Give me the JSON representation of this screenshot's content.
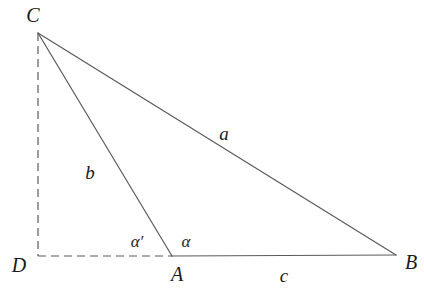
{
  "figure": {
    "type": "geometry-diagram",
    "background_color": "#ffffff",
    "stroke_color": "#5a5a5a",
    "label_color": "#1a1a1a",
    "width": 424,
    "height": 298
  },
  "points": {
    "C": {
      "label": "C",
      "x": 38,
      "y": 33,
      "label_x": 33,
      "label_y": 15
    },
    "D": {
      "label": "D",
      "x": 38,
      "y": 256,
      "label_x": 19,
      "label_y": 265
    },
    "A": {
      "label": "A",
      "x": 172,
      "y": 256,
      "label_x": 177,
      "label_y": 274
    },
    "B": {
      "label": "B",
      "x": 396,
      "y": 255,
      "label_x": 411,
      "label_y": 262
    }
  },
  "segments": [
    {
      "name": "side-a",
      "from": "C",
      "to": "B",
      "style": "solid"
    },
    {
      "name": "side-b",
      "from": "C",
      "to": "A",
      "style": "solid"
    },
    {
      "name": "side-c",
      "from": "A",
      "to": "B",
      "style": "solid"
    },
    {
      "name": "altitude-h",
      "from": "C",
      "to": "D",
      "style": "dashed"
    },
    {
      "name": "base-extension",
      "from": "D",
      "to": "A",
      "style": "dashed"
    }
  ],
  "side_labels": {
    "a": {
      "text": "a",
      "x": 224,
      "y": 133
    },
    "b": {
      "text": "b",
      "x": 90,
      "y": 172
    },
    "c": {
      "text": "c",
      "x": 284,
      "y": 275
    }
  },
  "angle_labels": {
    "alpha_prime": {
      "text": "α′",
      "x": 137,
      "y": 241
    },
    "alpha": {
      "text": "α",
      "x": 186,
      "y": 241
    }
  }
}
